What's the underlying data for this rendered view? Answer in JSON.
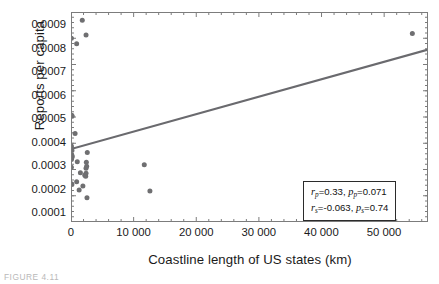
{
  "figure": {
    "caption": "FIGURE 4.11"
  },
  "axes": {
    "xlabel": "Coastline length of US states (km)",
    "ylabel": "Reports per capita",
    "xticks": [
      "0",
      "10 000",
      "20 000",
      "30 000",
      "40 000",
      "50 000"
    ],
    "yticks": [
      "0.0001",
      "0.0002",
      "0.0003",
      "0.0004",
      "0.0005",
      "0.0006",
      "0.0007",
      "0.0008",
      "0.0009"
    ]
  },
  "stats": {
    "pearson": {
      "r_symbol": "r",
      "r_sub": "p",
      "r_value": "=0.33,",
      "p_symbol": "p",
      "p_sub": "p",
      "p_value": "=0.071"
    },
    "spearman": {
      "r_symbol": "r",
      "r_sub": "s",
      "r_value": "=-0.063,",
      "p_symbol": "p",
      "p_sub": "s",
      "p_value": "=0.74"
    }
  },
  "colors": {
    "point": "#6f6f71",
    "trendline": "#6a6a6e",
    "frame": "#7c7c7c",
    "text": "#1a1a1a"
  },
  "chart_data": {
    "type": "scatter",
    "title": "",
    "xlabel": "Coastline length of US states (km)",
    "ylabel": "Reports per capita",
    "xlim": [
      0,
      57000
    ],
    "ylim": [
      0.0001,
      0.0009
    ],
    "grid": false,
    "legend": null,
    "marker": {
      "shape": "circle",
      "size_px": 5,
      "color": "#6f6f71"
    },
    "points": [
      {
        "x": 1800,
        "y": 0.000869
      },
      {
        "x": 2400,
        "y": 0.000812
      },
      {
        "x": 60,
        "y": 0.0008
      },
      {
        "x": 900,
        "y": 0.000779
      },
      {
        "x": 120,
        "y": 0.000507
      },
      {
        "x": 180,
        "y": 0.000503
      },
      {
        "x": 650,
        "y": 0.000437
      },
      {
        "x": 60,
        "y": 0.00039
      },
      {
        "x": 90,
        "y": 0.000382
      },
      {
        "x": 150,
        "y": 0.000372
      },
      {
        "x": 2600,
        "y": 0.000365
      },
      {
        "x": 120,
        "y": 0.000355
      },
      {
        "x": 200,
        "y": 0.00035
      },
      {
        "x": 110,
        "y": 0.000344
      },
      {
        "x": 70,
        "y": 0.000338
      },
      {
        "x": 1000,
        "y": 0.00033
      },
      {
        "x": 2450,
        "y": 0.000328
      },
      {
        "x": 2500,
        "y": 0.000312
      },
      {
        "x": 60,
        "y": 0.000309
      },
      {
        "x": 2400,
        "y": 0.000305
      },
      {
        "x": 1500,
        "y": 0.000288
      },
      {
        "x": 2400,
        "y": 0.000286
      },
      {
        "x": 2200,
        "y": 0.000278
      },
      {
        "x": 2350,
        "y": 0.000274
      },
      {
        "x": 11700,
        "y": 0.000318
      },
      {
        "x": 900,
        "y": 0.000253
      },
      {
        "x": 80,
        "y": 0.000246
      },
      {
        "x": 140,
        "y": 0.000243
      },
      {
        "x": 1900,
        "y": 0.000237
      },
      {
        "x": 1300,
        "y": 0.000222
      },
      {
        "x": 2550,
        "y": 0.000192
      },
      {
        "x": 12600,
        "y": 0.000218
      },
      {
        "x": 54500,
        "y": 0.000818
      }
    ],
    "trendline": {
      "type": "linear",
      "x0": 0,
      "y0": 0.000378,
      "x1": 57000,
      "y1": 0.000757,
      "color": "#6a6a6e"
    },
    "annotations": [
      "r_p=0.33, p_p=0.071",
      "r_s=-0.063, p_s=0.74"
    ]
  }
}
